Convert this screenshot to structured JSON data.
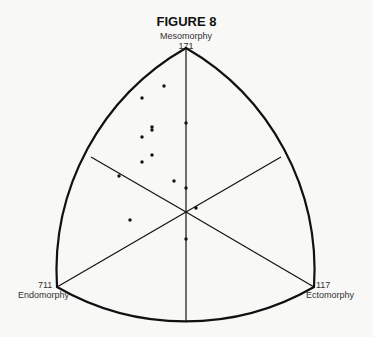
{
  "title": "FIGURE 8",
  "vertices": {
    "top": {
      "name": "Mesomorphy",
      "code": "171"
    },
    "left": {
      "name": "Endomorphy",
      "code": "711"
    },
    "right": {
      "name": "Ectomorphy",
      "code": "117"
    }
  },
  "colors": {
    "ink": "#111111",
    "background": "#f8f8f6"
  },
  "points_description": "Somatotype plot points (scattered mostly in the mesomorphic sector)",
  "points_count": 15
}
